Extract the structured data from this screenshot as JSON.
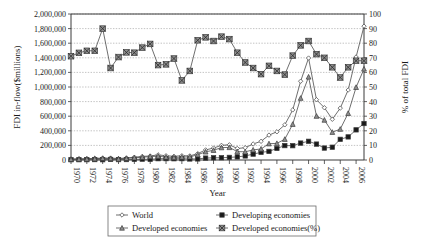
{
  "chart_data": {
    "type": "line",
    "title": "",
    "xlabel": "Year",
    "ylabel": "FDI in-flow($millions)",
    "y2label": "% of total FDI",
    "x": [
      1970,
      1971,
      1972,
      1973,
      1974,
      1975,
      1976,
      1977,
      1978,
      1979,
      1980,
      1981,
      1982,
      1983,
      1984,
      1985,
      1986,
      1987,
      1988,
      1989,
      1990,
      1991,
      1992,
      1993,
      1994,
      1995,
      1996,
      1997,
      1998,
      1999,
      2000,
      2001,
      2002,
      2003,
      2004,
      2005,
      2006,
      2007
    ],
    "xtick_labels": [
      "1970",
      "1972",
      "1974",
      "1976",
      "1978",
      "1980",
      "1982",
      "1984",
      "1986",
      "1988",
      "1990",
      "1992",
      "1994",
      "1996",
      "1998",
      "2000",
      "2002",
      "2004",
      "2006"
    ],
    "ytick_labels": [
      "0",
      "200,000",
      "400,000",
      "600,000",
      "800,000",
      "1,000,000",
      "1,200,000",
      "1,400,000",
      "1,600,000",
      "1,800,000",
      "2,000,000"
    ],
    "y2tick_labels": [
      "0",
      "10",
      "20",
      "30",
      "40",
      "50",
      "60",
      "70",
      "80",
      "90",
      "100"
    ],
    "ylim": [
      0,
      2000000
    ],
    "y2lim": [
      0,
      100
    ],
    "xlim": [
      1970,
      2007
    ],
    "grid": true,
    "legend_position": "bottom",
    "series": [
      {
        "name": "World",
        "axis": "left",
        "marker": "diamond-open",
        "values": [
          13346,
          16076,
          18065,
          22730,
          26283,
          26648,
          19983,
          28134,
          38478,
          49224,
          55254,
          70220,
          58076,
          51024,
          58339,
          56182,
          87129,
          138030,
          163601,
          200647,
          207878,
          157773,
          168123,
          219421,
          255982,
          341086,
          386140,
          481911,
          686028,
          1079083,
          1396539,
          825925,
          716128,
          557869,
          710755,
          958697,
          1411018,
          1833324
        ]
      },
      {
        "name": "Developing economies",
        "axis": "left",
        "marker": "square-solid",
        "values": [
          3854,
          4267,
          4551,
          5729,
          3874,
          7785,
          5570,
          6230,
          8377,
          11458,
          8292,
          17985,
          18765,
          17177,
          18478,
          14050,
          15008,
          26009,
          30273,
          30889,
          35610,
          42738,
          55805,
          80828,
          104828,
          117703,
          158439,
          197210,
          196007,
          231871,
          256101,
          217845,
          163580,
          175138,
          283030,
          316443,
          412990,
          499747
        ]
      },
      {
        "name": "Developed economies",
        "axis": "left",
        "marker": "triangle-grey",
        "values": [
          9492,
          11809,
          13514,
          17001,
          22409,
          18863,
          14413,
          21904,
          30101,
          37766,
          46962,
          52235,
          39311,
          33847,
          39861,
          42132,
          72121,
          112021,
          133328,
          169758,
          172268,
          115035,
          112318,
          138593,
          151154,
          223383,
          227701,
          284700,
          490055,
          847172,
          1138120,
          601015,
          547549,
          380818,
          422707,
          639721,
          996049,
          1247635
        ]
      },
      {
        "name": "Developed economies(%)",
        "axis": "right",
        "marker": "x-cross",
        "values": [
          71.1,
          73.4,
          74.8,
          74.8,
          90.0,
          63.0,
          70.5,
          73.7,
          73.5,
          77.0,
          79.5,
          65.0,
          65.5,
          69.5,
          54.5,
          61.0,
          82.0,
          84.0,
          81.5,
          84.5,
          82.8,
          73.5,
          66.8,
          63.0,
          58.8,
          64.5,
          61.0,
          58.5,
          71.5,
          78.5,
          81.5,
          72.5,
          70.0,
          63.5,
          56.5,
          63.5,
          68.0,
          68.0
        ]
      }
    ]
  },
  "legend": {
    "items": [
      {
        "label": "World",
        "marker": "diamond-open"
      },
      {
        "label": "Developing economies",
        "marker": "square-solid"
      },
      {
        "label": "Developed economies",
        "marker": "triangle-grey"
      },
      {
        "label": "Developed economies(%)",
        "marker": "x-cross"
      }
    ]
  }
}
